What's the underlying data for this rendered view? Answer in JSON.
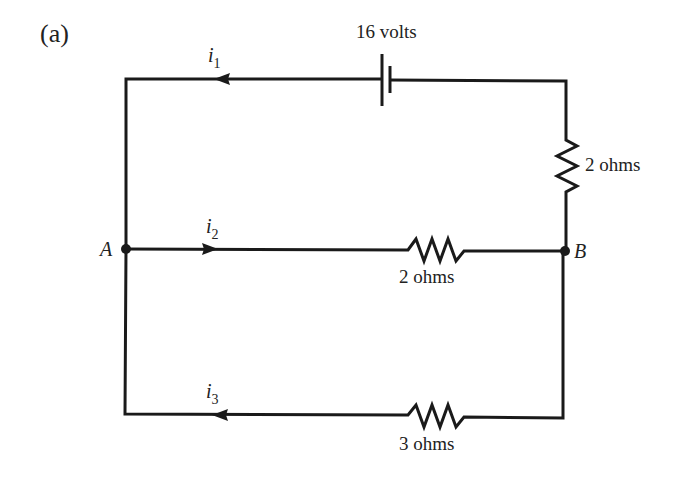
{
  "figure_label": "(a)",
  "battery": {
    "label": "16 volts",
    "voltage": 16
  },
  "resistors": [
    {
      "id": "right",
      "label": "2 ohms",
      "ohms": 2
    },
    {
      "id": "middle",
      "label": "2 ohms",
      "ohms": 2
    },
    {
      "id": "bottom",
      "label": "3 ohms",
      "ohms": 3
    }
  ],
  "nodes": {
    "left": "A",
    "right": "B"
  },
  "currents": [
    {
      "symbol": "i",
      "subscript": "1",
      "direction": "left"
    },
    {
      "symbol": "i",
      "subscript": "2",
      "direction": "right"
    },
    {
      "symbol": "i",
      "subscript": "3",
      "direction": "left"
    }
  ],
  "colors": {
    "line": "#1a1a1a",
    "text": "#222222",
    "background": "#ffffff"
  }
}
